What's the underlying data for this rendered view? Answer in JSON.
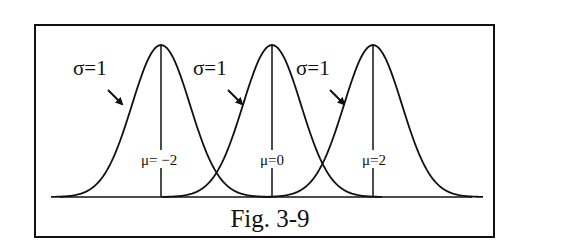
{
  "figure": {
    "caption": "Fig. 3-9",
    "colors": {
      "line": "#111111",
      "background": "#ffffff"
    }
  },
  "curves": [
    {
      "sigma_label": "σ=1",
      "mu_label": "μ= −2",
      "mu": -2,
      "sigma": 1
    },
    {
      "sigma_label": "σ=1",
      "mu_label": "μ=0",
      "mu": 0,
      "sigma": 1
    },
    {
      "sigma_label": "σ=1",
      "mu_label": "μ=2",
      "mu": 2,
      "sigma": 1
    }
  ],
  "chart_data": {
    "type": "line",
    "title": "Fig. 3-9",
    "series": [
      {
        "name": "σ=1, μ=-2",
        "mu": -2,
        "sigma": 1
      },
      {
        "name": "σ=1, μ=0",
        "mu": 0,
        "sigma": 1
      },
      {
        "name": "σ=1, μ=2",
        "mu": 2,
        "sigma": 1
      }
    ],
    "annotations": [
      "σ=1",
      "σ=1",
      "σ=1",
      "μ= −2",
      "μ=0",
      "μ=2"
    ],
    "xlabel": "",
    "ylabel": "",
    "grid": false
  }
}
